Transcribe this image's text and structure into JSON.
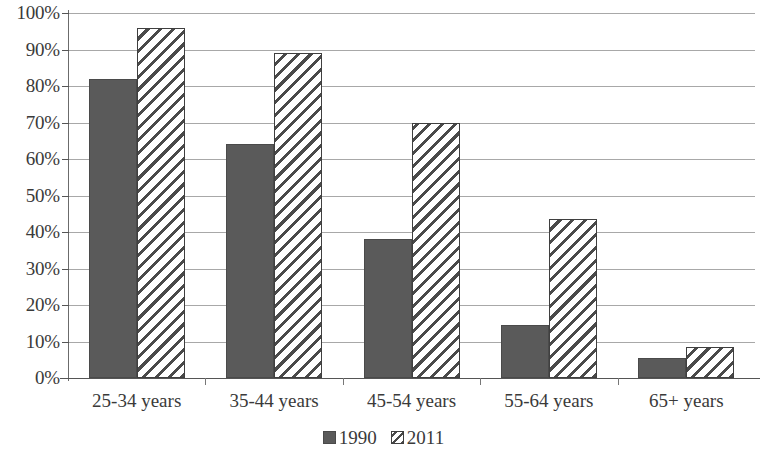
{
  "chart_data": {
    "type": "bar",
    "title": "",
    "subtitle": "",
    "xlabel": "",
    "ylabel": "",
    "categories": [
      "25-34 years",
      "35-44 years",
      "45-54 years",
      "55-64 years",
      "65+ years"
    ],
    "series": [
      {
        "name": "1990",
        "values": [
          82,
          64,
          38,
          14.5,
          5.5
        ],
        "style": "solid",
        "color": "#5a5a5a"
      },
      {
        "name": "2011",
        "values": [
          96,
          89,
          70,
          43.5,
          8.5
        ],
        "style": "diagonal-hatch",
        "color": "#ffffff"
      }
    ],
    "ylim": [
      0,
      100
    ],
    "ytick_labels": [
      "100%",
      "90%",
      "80%",
      "70%",
      "60%",
      "50%",
      "40%",
      "30%",
      "20%",
      "10%",
      "0%"
    ],
    "ytick_values": [
      100,
      90,
      80,
      70,
      60,
      50,
      40,
      30,
      20,
      10,
      0
    ],
    "grid": true,
    "grid_axis": "y",
    "legend_position": "bottom",
    "legend_entries": [
      "1990",
      "2011"
    ]
  },
  "axis": {
    "y_labels": [
      "100%",
      "90%",
      "80%",
      "70%",
      "60%",
      "50%",
      "40%",
      "30%",
      "20%",
      "10%",
      "0%"
    ],
    "x_labels": [
      "25-34 years",
      "35-44 years",
      "45-54 years",
      "55-64 years",
      "65+ years"
    ]
  },
  "legend": {
    "items": [
      {
        "label": "1990"
      },
      {
        "label": "2011"
      }
    ]
  },
  "colors": {
    "series_1990": "#5a5a5a",
    "series_2011": "#ffffff",
    "hatch": "#4a4a4a",
    "gridline": "#a8a8a8",
    "axis": "#555555",
    "text": "#3a3a3a",
    "background": "#ffffff"
  }
}
